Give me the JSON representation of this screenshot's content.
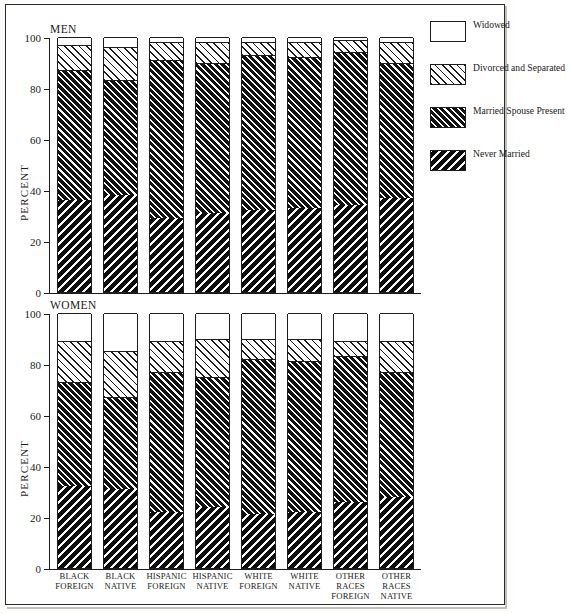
{
  "panels": [
    {
      "title": "MEN"
    },
    {
      "title": "WOMEN"
    }
  ],
  "axis": {
    "y_caption": "PERCENT",
    "y_ticks": [
      "0",
      "20",
      "40",
      "60",
      "80",
      "100"
    ]
  },
  "categories": [
    "BLACK\nFOREIGN",
    "BLACK\nNATIVE",
    "HISPANIC\nFOREIGN",
    "HISPANIC\nNATIVE",
    "WHITE\nFOREIGN",
    "WHITE\nNATIVE",
    "OTHER\nRACES\nFOREIGN",
    "OTHER\nRACES\nNATIVE"
  ],
  "legend": [
    {
      "label": "Widowed",
      "pattern": "pat-widowed"
    },
    {
      "label": "Divorced and Separated",
      "pattern": "pat-divorced"
    },
    {
      "label": "Married Spouse Present",
      "pattern": "pat-married"
    },
    {
      "label": "Never Married",
      "pattern": "pat-never"
    }
  ],
  "colors": {
    "ink": "#1c1c1c",
    "paper": "#ffffff",
    "frame": "#2b2b2b"
  },
  "chart_data": {
    "type": "bar",
    "subtype": "stacked-vertical",
    "xlabel": "",
    "ylabel": "PERCENT",
    "ylim": [
      0,
      100
    ],
    "yticks": [
      0,
      20,
      40,
      60,
      80,
      100
    ],
    "grid": false,
    "legend_position": "right",
    "stack_order_bottom_to_top": [
      "Never Married",
      "Married Spouse Present",
      "Divorced and Separated",
      "Widowed"
    ],
    "categories": [
      "BLACK FOREIGN",
      "BLACK NATIVE",
      "HISPANIC FOREIGN",
      "HISPANIC NATIVE",
      "WHITE FOREIGN",
      "WHITE NATIVE",
      "OTHER RACES FOREIGN",
      "OTHER RACES NATIVE"
    ],
    "panels": [
      {
        "name": "MEN",
        "series": [
          {
            "name": "Never Married",
            "values": [
              36,
              38,
              29,
              31,
              32,
              33,
              34,
              37
            ]
          },
          {
            "name": "Married Spouse Present",
            "values": [
              51,
              45,
              62,
              59,
              61,
              59,
              60,
              53
            ]
          },
          {
            "name": "Divorced and Separated",
            "values": [
              10,
              13,
              7,
              8,
              5,
              6,
              5,
              8
            ]
          },
          {
            "name": "Widowed",
            "values": [
              3,
              4,
              2,
              2,
              2,
              2,
              1,
              2
            ]
          }
        ],
        "cumulative_tops": {
          "Never Married": [
            36,
            38,
            29,
            31,
            32,
            33,
            34,
            37
          ],
          "Married Spouse Present": [
            87,
            83,
            91,
            90,
            93,
            92,
            94,
            90
          ],
          "Divorced and Separated": [
            97,
            96,
            98,
            98,
            98,
            98,
            99,
            98
          ],
          "Widowed": [
            100,
            100,
            100,
            100,
            100,
            100,
            100,
            100
          ]
        }
      },
      {
        "name": "WOMEN",
        "series": [
          {
            "name": "Never Married",
            "values": [
              32,
              31,
              22,
              24,
              21,
              22,
              26,
              28
            ]
          },
          {
            "name": "Married Spouse Present",
            "values": [
              41,
              36,
              55,
              51,
              61,
              59,
              57,
              49
            ]
          },
          {
            "name": "Divorced and Separated",
            "values": [
              16,
              18,
              12,
              15,
              8,
              9,
              6,
              12
            ]
          },
          {
            "name": "Widowed",
            "values": [
              11,
              15,
              11,
              10,
              10,
              10,
              11,
              11
            ]
          }
        ],
        "cumulative_tops": {
          "Never Married": [
            32,
            31,
            22,
            24,
            21,
            22,
            26,
            28
          ],
          "Married Spouse Present": [
            73,
            67,
            77,
            75,
            82,
            81,
            83,
            77
          ],
          "Divorced and Separated": [
            89,
            85,
            89,
            90,
            90,
            90,
            89,
            89
          ],
          "Widowed": [
            100,
            100,
            100,
            100,
            100,
            100,
            100,
            100
          ]
        }
      }
    ]
  }
}
